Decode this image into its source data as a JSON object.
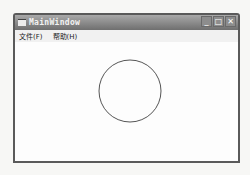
{
  "window": {
    "title": "MainWindow",
    "controls": {
      "minimize": "_",
      "maximize": "□",
      "close": "✕"
    }
  },
  "menubar": {
    "items": [
      {
        "label": "文件(F)"
      },
      {
        "label": "帮助(H)"
      }
    ]
  },
  "canvas": {
    "shape": "circle",
    "circle": {
      "cx": 130,
      "cy": 91,
      "r": 31,
      "stroke": "#555555"
    }
  }
}
